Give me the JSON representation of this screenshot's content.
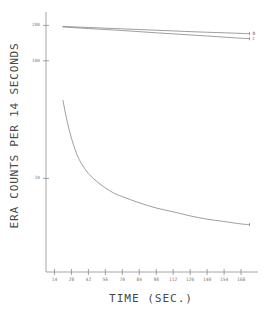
{
  "chart_data": {
    "type": "line",
    "title": "",
    "subtitle": "",
    "xlabel": "TIME (SEC.)",
    "ylabel": "ERA COUNTS PER 14 SECONDS",
    "yscale": "log",
    "xscale": "linear",
    "grid": false,
    "legend_position": "right-inline",
    "xlim": [
      7,
      182
    ],
    "ylim": [
      1.6,
      260
    ],
    "xticks": [
      14,
      28,
      42,
      56,
      70,
      84,
      98,
      112,
      126,
      140,
      154,
      168
    ],
    "xtick_labels": [
      "14",
      "28",
      "42",
      "56",
      "70",
      "84",
      "98",
      "112",
      "126",
      "140",
      "154",
      "168"
    ],
    "yticks": [
      200,
      100,
      10
    ],
    "ytick_labels": [
      "200",
      "100",
      "10"
    ],
    "line_color": "#7d7d7d",
    "axis_color": "#8a8a8a",
    "background": "#ffffff",
    "series": [
      {
        "name": "A",
        "label": "",
        "x": [
          21,
          23,
          25,
          28,
          32,
          36,
          42,
          49,
          56,
          63,
          70,
          84,
          98,
          112,
          126,
          140,
          154,
          168,
          175
        ],
        "values": [
          46,
          36,
          29,
          22,
          16.5,
          13.5,
          11.0,
          9.4,
          8.3,
          7.5,
          7.0,
          6.2,
          5.6,
          5.2,
          4.8,
          4.5,
          4.3,
          4.1,
          4.05
        ]
      },
      {
        "name": "B",
        "label": "B",
        "x": [
          21,
          42,
          70,
          98,
          126,
          154,
          175
        ],
        "values": [
          196,
          192,
          187,
          182,
          177,
          173,
          170
        ]
      },
      {
        "name": "C",
        "label": "C",
        "x": [
          21,
          42,
          70,
          98,
          126,
          154,
          175
        ],
        "values": [
          194,
          188,
          181,
          173,
          166,
          159,
          154
        ]
      }
    ]
  }
}
